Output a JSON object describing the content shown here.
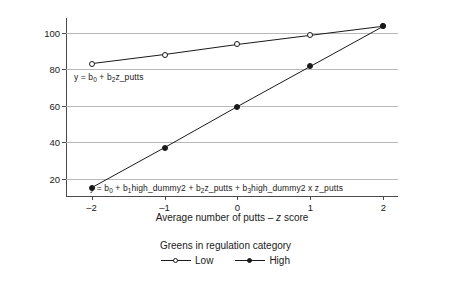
{
  "chart_data": {
    "type": "line",
    "title": "",
    "xlabel": "Average number of putts – z score",
    "ylabel": "Predicted money rank",
    "x": [
      -2,
      -1,
      0,
      1,
      2
    ],
    "xticklabels": [
      "–2",
      "–1",
      "0",
      "1",
      "2"
    ],
    "yticks": [
      20,
      40,
      60,
      80,
      100
    ],
    "yticklabels": [
      "20",
      "40",
      "60",
      "80",
      "100"
    ],
    "xlim": [
      -2.35,
      2.2
    ],
    "ylim": [
      10.5,
      108
    ],
    "grid": "horizontal",
    "legend_position": "bottom",
    "legend_title": "Greens in regulation category",
    "series": [
      {
        "name": "Low",
        "marker": "open-circle",
        "color": "#1a1a1a",
        "values": [
          83,
          88,
          93.5,
          98.5,
          103.5
        ]
      },
      {
        "name": "High",
        "marker": "filled-circle",
        "color": "#1a1a1a",
        "values": [
          15,
          37,
          59.5,
          81.5,
          103.5
        ]
      }
    ],
    "annotations": [
      {
        "id": "eq-low",
        "text": "y  = b0 + b2z_putts",
        "parts": [
          "y  = b",
          "0",
          " + b",
          "2",
          "z_putts"
        ],
        "series": "Low"
      },
      {
        "id": "eq-high",
        "text": "y  = b0 + b1high_dummy2 + b2z_putts + b3high_dummy2 x z_putts",
        "parts": [
          "y  = b",
          "0",
          " + b",
          "1",
          "high_dummy2 + b",
          "2",
          "z_putts + b",
          "3",
          "high_dummy2 x z_putts"
        ],
        "series": "High"
      }
    ]
  },
  "colors": {
    "ink": "#1a1a1a",
    "axis": "#4a4a4a",
    "grid": "#b9b9b9",
    "background": "#ffffff"
  }
}
